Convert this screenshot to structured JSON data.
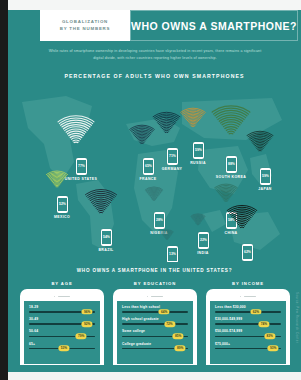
{
  "poster": {
    "background_color": "#2a8a87",
    "accent_color": "#f2d64b"
  },
  "header": {
    "logo_line1": "GLOBALIZATION",
    "logo_line2": "BY THE NUMBERS",
    "title": "WHO OWNS A SMARTPHONE?"
  },
  "subtitle": "While rates of smartphone ownership in developing countries have skyrocketed in recent years, there remains a significant digital divide, with richer countries reporting higher levels of ownership.",
  "map_section": {
    "label": "PERCENTAGE OF ADULTS WHO OWN SMARTPHONES"
  },
  "chart_data": {
    "type": "bar",
    "title": "PERCENTAGE OF ADULTS WHO OWN SMARTPHONES",
    "xlabel": "",
    "ylabel": "Percent of adults owning a smartphone",
    "ylim": [
      0,
      100
    ],
    "categories": [
      "UNITED STATES",
      "MEXICO",
      "BRAZIL",
      "FRANCE",
      "GERMANY",
      "NIGERIA",
      "RUSSIA",
      "SOUTH KOREA",
      "JAPAN",
      "TANZANIA",
      "INDIA",
      "CHINA",
      "MALAYSIA"
    ],
    "values": [
      77,
      52,
      54,
      65,
      71,
      28,
      59,
      88,
      59,
      13,
      22,
      58,
      62
    ]
  },
  "countries": [
    {
      "name": "UNITED STATES",
      "value": "77%",
      "x": 62,
      "y": 74,
      "label_x": 67,
      "label_y": 93,
      "fan_color": "#e8f2f0",
      "fan_size": 44,
      "fan_x": 40,
      "fan_y": 30
    },
    {
      "name": "MEXICO",
      "value": "52%",
      "x": 43,
      "y": 112,
      "label_x": 48,
      "label_y": 131,
      "fan_color": "#d8e84a",
      "fan_size": 26,
      "fan_x": 30,
      "fan_y": 86
    },
    {
      "name": "BRAZIL",
      "value": "54%",
      "x": 87,
      "y": 145,
      "label_x": 92,
      "label_y": 164,
      "fan_color": "#1d2f3a",
      "fan_size": 38,
      "fan_x": 68,
      "fan_y": 104
    },
    {
      "name": "FRANCE",
      "value": "65%",
      "x": 129,
      "y": 74,
      "label_x": 134,
      "label_y": 93,
      "fan_color": "#173243",
      "fan_size": 30,
      "fan_x": 113,
      "fan_y": 40
    },
    {
      "name": "GERMANY",
      "value": "71%",
      "x": 153,
      "y": 64,
      "label_x": 158,
      "label_y": 83,
      "fan_color": "#12313f",
      "fan_size": 33,
      "fan_x": 136,
      "fan_y": 27
    },
    {
      "name": "NIGERIA",
      "value": "28%",
      "x": 140,
      "y": 128,
      "label_x": 145,
      "label_y": 147,
      "fan_color": "#2f6a68",
      "fan_size": 22,
      "fan_x": 129,
      "fan_y": 102
    },
    {
      "name": "RUSSIA",
      "value": "59%",
      "x": 179,
      "y": 58,
      "label_x": 184,
      "label_y": 77,
      "fan_color": "#d8922a",
      "fan_size": 30,
      "fan_x": 164,
      "fan_y": 23
    },
    {
      "name": "SOUTH KOREA",
      "value": "88%",
      "x": 212,
      "y": 72,
      "label_x": 217,
      "label_y": 91,
      "fan_color": "#3f7d4a",
      "fan_size": 46,
      "fan_x": 194,
      "fan_y": 20
    },
    {
      "name": "JAPAN",
      "value": "59%",
      "x": 246,
      "y": 84,
      "label_x": 251,
      "label_y": 103,
      "fan_color": "#16312c",
      "fan_size": 32,
      "fan_x": 230,
      "fan_y": 46
    },
    {
      "name": "TANZANIA",
      "value": "13%",
      "x": 153,
      "y": 162,
      "label_x": 158,
      "label_y": 181,
      "fan_color": "#2f6a68",
      "fan_size": 16,
      "fan_x": 145,
      "fan_y": 145
    },
    {
      "name": "INDIA",
      "value": "22%",
      "x": 184,
      "y": 148,
      "label_x": 189,
      "label_y": 167,
      "fan_color": "#2f6a68",
      "fan_size": 18,
      "fan_x": 175,
      "fan_y": 129
    },
    {
      "name": "CHINA",
      "value": "58%",
      "x": 212,
      "y": 128,
      "label_x": 217,
      "label_y": 147,
      "fan_color": "#2d6e5c",
      "fan_size": 28,
      "fan_x": 198,
      "fan_y": 99
    },
    {
      "name": "MALAYSIA",
      "value": "62%",
      "x": 228,
      "y": 160,
      "label_x": 233,
      "label_y": 179,
      "fan_color": "#101a16",
      "fan_size": 36,
      "fan_x": 210,
      "fan_y": 120
    }
  ],
  "us_section": {
    "title": "WHO OWNS A SMARTPHONE IN THE UNITED STATES?",
    "panels": [
      {
        "title": "BY AGE",
        "rows": [
          {
            "label": "18-29",
            "value": "96%",
            "pct": 96
          },
          {
            "label": "30-49",
            "value": "92%",
            "pct": 92
          },
          {
            "label": "50-64",
            "value": "79%",
            "pct": 79
          },
          {
            "label": "65+",
            "value": "53%",
            "pct": 53
          }
        ]
      },
      {
        "title": "BY EDUCATION",
        "rows": [
          {
            "label": "Less than high school",
            "value": "64%",
            "pct": 64
          },
          {
            "label": "High school graduate",
            "value": "72%",
            "pct": 72
          },
          {
            "label": "Some college",
            "value": "85%",
            "pct": 85
          },
          {
            "label": "College graduate",
            "value": "89%",
            "pct": 89
          }
        ]
      },
      {
        "title": "BY INCOME",
        "rows": [
          {
            "label": "Less than $30,000",
            "value": "62%",
            "pct": 62
          },
          {
            "label": "$30,000-$49,999",
            "value": "74%",
            "pct": 74
          },
          {
            "label": "$50,000-$74,999",
            "value": "83%",
            "pct": 83
          },
          {
            "label": "$75,000+",
            "value": "93%",
            "pct": 93
          }
        ]
      }
    ]
  },
  "credit": "Source: Pew Research Center"
}
